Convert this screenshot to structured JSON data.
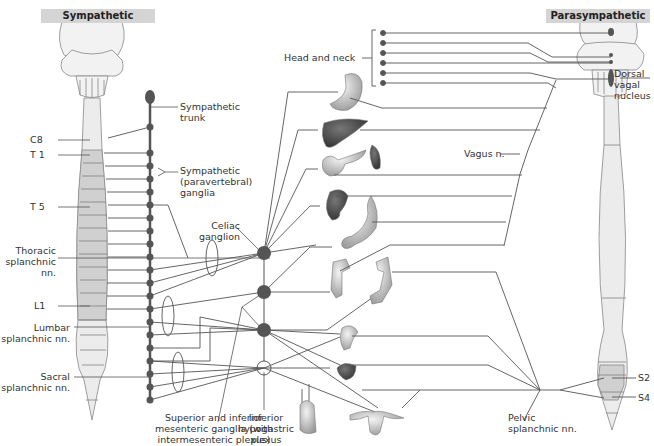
{
  "headers": {
    "sympathetic": "Sympathetic",
    "parasympathetic": "Parasympathetic"
  },
  "labels": {
    "c8": "C8",
    "t1": "T 1",
    "t5": "T 5",
    "l1": "L1",
    "sympathetic_trunk": [
      "Sympathetic",
      "trunk"
    ],
    "paravertebral_ganglia": [
      "Sympathetic",
      "(paravertebral)",
      "ganglia"
    ],
    "celiac_ganglion": [
      "Celiac",
      "ganglion"
    ],
    "thoracic_splanchnic": [
      "Thoracic",
      "splanchnic",
      "nn."
    ],
    "lumbar_splanchnic": [
      "Lumbar",
      "splanchnic nn."
    ],
    "sacral_splanchnic": [
      "Sacral",
      "splanchnic nn."
    ],
    "mesenteric_ganglia": [
      "Superior and inferior",
      "mesenteric ganglia (with",
      "intermesenteric plexus)"
    ],
    "inferior_hypogastric": [
      "Inferior",
      "hypogastric",
      "plexus"
    ],
    "head_and_neck": "Head and neck",
    "vagus": "Vagus n.",
    "dorsal_vagal": [
      "Dorsal",
      "vagal",
      "nucleus"
    ],
    "pelvic_splanchnic": [
      "Pelvic",
      "splanchnic nn."
    ],
    "s2": "S2",
    "s4": "S4"
  },
  "organs": [
    "stomach",
    "liver",
    "pancreas",
    "spleen",
    "kidney",
    "small-intestine",
    "ascending-colon",
    "descending-colon",
    "rectum",
    "bladder",
    "male-genitalia",
    "female-genitalia"
  ],
  "colors": {
    "line": "#555555",
    "node": "#555555",
    "spine_fill": "#ececec",
    "segment_fill": "#d0d0d0",
    "header_bg": "#d4d4d4"
  }
}
